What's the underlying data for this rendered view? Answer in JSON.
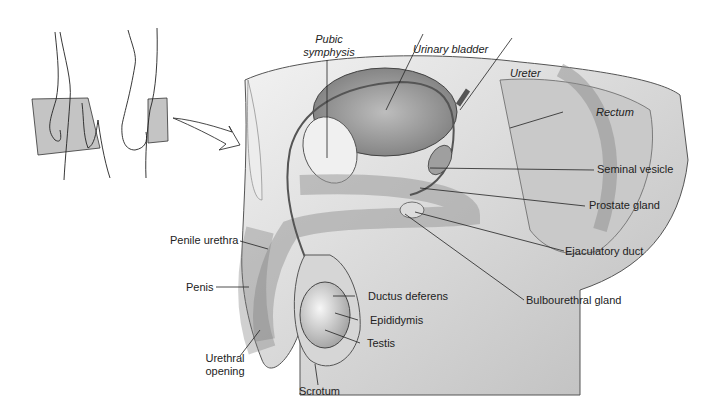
{
  "figure": {
    "orientation_inset": {
      "description": "figure standing with shaded sagittal plane",
      "arrow": "curved-arrow-pointing-to-section"
    },
    "labels": {
      "pubic_symphysis_line1": "Pubic",
      "pubic_symphysis_line2": "symphysis",
      "urinary_bladder": "Urinary bladder",
      "ureter": "Ureter",
      "rectum": "Rectum",
      "seminal_vesicle": "Seminal vesicle",
      "prostate_gland": "Prostate gland",
      "ejaculatory_duct": "Ejaculatory duct",
      "bulbourethral_gland": "Bulbourethral gland",
      "penile_urethra": "Penile urethra",
      "penis": "Penis",
      "ductus_deferens": "Ductus deferens",
      "epididymis": "Epididymis",
      "testis": "Testis",
      "urethral_opening_line1": "Urethral",
      "urethral_opening_line2": "opening",
      "scrotum": "Scrotum"
    },
    "colors": {
      "line": "#222222",
      "tissue": "#d9d9d9",
      "shadow": "#8a8a8a",
      "plane": "#bdbdbd"
    }
  }
}
